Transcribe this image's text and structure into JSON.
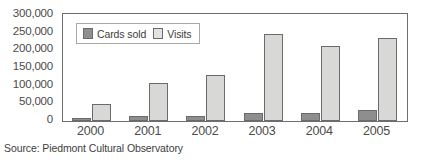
{
  "chart_data": {
    "type": "bar",
    "title": "",
    "xlabel": "",
    "ylabel": "",
    "categories": [
      "2000",
      "2001",
      "2002",
      "2003",
      "2004",
      "2005"
    ],
    "series": [
      {
        "name": "Cards sold",
        "color": "#8e8e8e",
        "values": [
          9000,
          14000,
          15000,
          22000,
          24000,
          31000
        ]
      },
      {
        "name": "Visits",
        "color": "#d8d8d6",
        "values": [
          48000,
          108000,
          130000,
          245000,
          213000,
          235000
        ]
      }
    ],
    "ylim": [
      0,
      300000
    ],
    "ytick_values": [
      300000,
      250000,
      200000,
      150000,
      100000,
      50000,
      0
    ],
    "ytick_labels": [
      "300,000",
      "250,000",
      "200,000",
      "150,000",
      "100,000",
      "50,000",
      "0"
    ],
    "grid": false,
    "legend_position": "top-left-inside",
    "frame": true
  },
  "legend": {
    "entries": [
      {
        "label": "Cards sold",
        "swatch": "dark-gray-swatch"
      },
      {
        "label": "Visits",
        "swatch": "light-gray-swatch"
      }
    ]
  },
  "source_note": "Source: Piedmont Cultural Observatory"
}
